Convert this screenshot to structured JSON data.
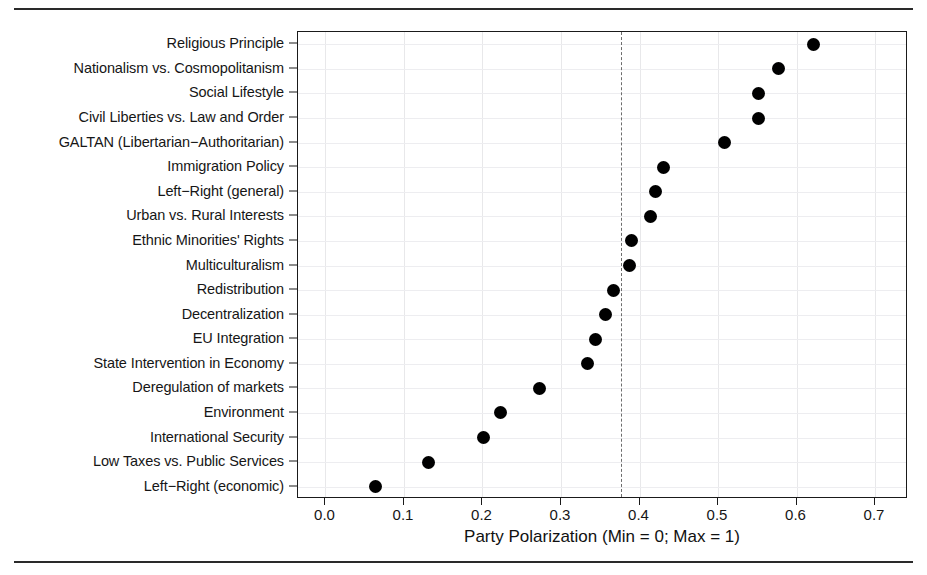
{
  "chart_data": {
    "type": "scatter",
    "orientation": "horizontal",
    "title": "",
    "xlabel": "Party Polarization (Min = 0; Max = 1)",
    "ylabel": "",
    "xlim": [
      -0.035,
      0.742
    ],
    "xticks": [
      "0.0",
      "0.1",
      "0.2",
      "0.3",
      "0.4",
      "0.5",
      "0.6",
      "0.7"
    ],
    "xtick_values": [
      0.0,
      0.1,
      0.2,
      0.3,
      0.4,
      0.5,
      0.6,
      0.7
    ],
    "grid": "both",
    "legend": "none",
    "marker": "filled-circle",
    "marker_color": "#000000",
    "reference_line": {
      "value": 0.376,
      "style": "dashed",
      "color": "#6d6d6d",
      "label": ""
    },
    "categories": [
      "Religious Principle",
      "Nationalism vs. Cosmopolitanism",
      "Social Lifestyle",
      "Civil Liberties vs. Law and Order",
      "GALTAN (Libertarian−Authoritarian)",
      "Immigration Policy",
      "Left−Right (general)",
      "Urban vs. Rural Interests",
      "Ethnic Minorities' Rights",
      "Multiculturalism",
      "Redistribution",
      "Decentralization",
      "EU Integration",
      "State Intervention in Economy",
      "Deregulation of markets",
      "Environment",
      "International Security",
      "Low Taxes vs. Public Services",
      "Left−Right (economic)"
    ],
    "values": [
      0.622,
      0.577,
      0.552,
      0.552,
      0.508,
      0.43,
      0.42,
      0.414,
      0.39,
      0.387,
      0.367,
      0.357,
      0.344,
      0.334,
      0.272,
      0.223,
      0.201,
      0.131,
      0.064
    ]
  }
}
